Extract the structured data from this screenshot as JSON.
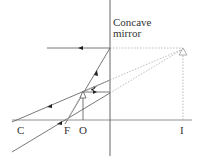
{
  "diagram": {
    "title": "Concave mirror",
    "mirror_label_line1": "Concave",
    "mirror_label_line2": "mirror",
    "axis_labels": {
      "C": "C",
      "F": "F",
      "O": "O",
      "I": "I"
    },
    "colors": {
      "ray": "#555555",
      "dotted": "#aaaaaa",
      "axis": "#666666"
    }
  }
}
